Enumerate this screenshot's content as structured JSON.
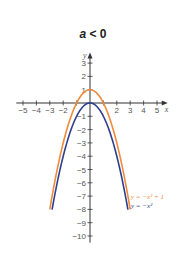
{
  "chart_data": {
    "type": "line",
    "title": "a < 0",
    "xlabel": "x",
    "ylabel": "y",
    "xlim": [
      -5.5,
      5.8
    ],
    "ylim": [
      -10.5,
      3.8
    ],
    "x_ticks": [
      -5,
      -4,
      -3,
      -2,
      -1,
      1,
      2,
      3,
      4,
      5
    ],
    "y_ticks": [
      3,
      2,
      1,
      -1,
      -2,
      -3,
      -4,
      -5,
      -6,
      -7,
      -8,
      -9,
      -10
    ],
    "grid": false,
    "series": [
      {
        "name": "y = −x² + 1",
        "expression": "-x^2+1",
        "color": "#f08a3c",
        "x_range": [
          -3,
          3
        ]
      },
      {
        "name": "y = −x²",
        "expression": "-x^2",
        "color": "#2e3f8f",
        "x_range": [
          -2.83,
          2.83
        ]
      }
    ],
    "legend_position": "lower right, next to curves"
  },
  "title": {
    "prefix": "a",
    "rest": " < 0"
  },
  "legend": [
    {
      "label": "y = −x² + 1",
      "color": "#f08a3c"
    },
    {
      "label": "y = −x²",
      "color": "#2e3f8f"
    }
  ]
}
